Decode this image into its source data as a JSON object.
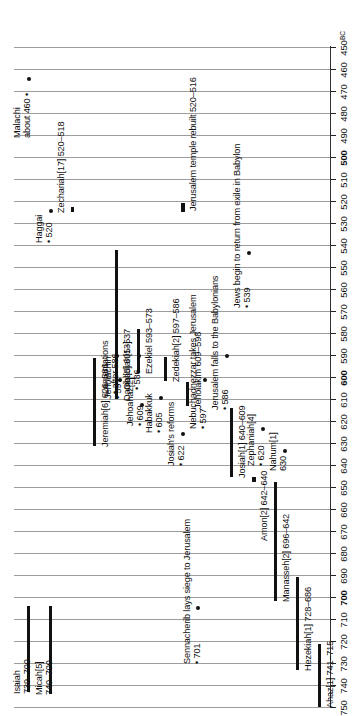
{
  "chart_data": {
    "type": "table",
    "orientation": "vertical-rotated",
    "xlabel": "",
    "ylabel": "BC",
    "axis_unit": "BC",
    "axis_range": [
      750,
      450
    ],
    "axis_direction": "750 at bottom to 450 at top",
    "tick_step": 10,
    "ticks": [
      750,
      740,
      730,
      720,
      710,
      700,
      690,
      680,
      670,
      660,
      650,
      640,
      630,
      620,
      610,
      600,
      590,
      580,
      570,
      560,
      550,
      540,
      530,
      520,
      510,
      500,
      490,
      480,
      470,
      460,
      450
    ],
    "bold_ticks": [
      700,
      600,
      500
    ],
    "grid": true,
    "legend": "none",
    "bars": [
      {
        "label": "Ahaz[1] 741–715",
        "name": "Ahaz",
        "bracket": "[1]",
        "start": 741,
        "end": 715
      },
      {
        "label": "Hezekiah[1] 728–686",
        "name": "Hezekiah",
        "bracket": "[1]",
        "start": 728,
        "end": 686
      },
      {
        "label": "Manasseh[2] 696–642",
        "name": "Manasseh",
        "bracket": "[2]",
        "start": 696,
        "end": 642
      },
      {
        "label": "Amon[2] 642–640",
        "name": "Amon",
        "bracket": "[2]",
        "start": 642,
        "end": 640
      },
      {
        "label": "Josiah[1] 640–609",
        "name": "Josiah",
        "bracket": "[1]",
        "start": 640,
        "end": 609
      },
      {
        "label": "Jehoiakim 609–598",
        "name": "Jehoiakim",
        "bracket": "",
        "start": 609,
        "end": 598
      },
      {
        "label": "Zedekiah[2] 597–586",
        "name": "Zedekiah",
        "bracket": "[2]",
        "start": 597,
        "end": 586
      },
      {
        "label": "Isaiah 739–700",
        "name": "Isaiah",
        "bracket": "",
        "start": 739,
        "end": 700
      },
      {
        "label": "Micah[5] 740–700",
        "name": "Micah",
        "bracket": "[5]",
        "start": 740,
        "end": 700
      },
      {
        "label": "Jeremiah[6] 626–586",
        "name": "Jeremiah",
        "bracket": "[6]",
        "start": 626,
        "end": 586
      },
      {
        "label": "Ezekiel 593–573",
        "name": "Ezekiel",
        "bracket": "",
        "start": 593,
        "end": 573
      },
      {
        "label": "Daniel[5] 605–537",
        "name": "Daniel",
        "bracket": "[5]",
        "start": 605,
        "end": 537
      },
      {
        "label": "Zechariah[17] 520–518",
        "name": "Zechariah",
        "bracket": "[17]",
        "start": 520,
        "end": 518
      },
      {
        "label": "Jerusalem temple rebuilt 520–516",
        "name": "Jerusalem temple rebuilt",
        "bracket": "",
        "start": 520,
        "end": 516
      }
    ],
    "points": [
      {
        "label": "Jehoahaz[2]",
        "sub": "• 609",
        "name": "Jehoahaz",
        "year": 609
      },
      {
        "label": "Jehoiachin",
        "sub": "• 597",
        "name": "Jehoiachin",
        "year": 597
      },
      {
        "label": "Nahum[1]",
        "sub": "630",
        "name": "Nahum",
        "year": 630
      },
      {
        "label": "Zephaniah[4]",
        "sub": "• 620",
        "name": "Zephaniah",
        "year": 620
      },
      {
        "label": "Habakkuk",
        "sub": "• 605",
        "name": "Habakkuk",
        "year": 605
      },
      {
        "label": "Obadiah[13]",
        "sub": "• 586",
        "name": "Obadiah",
        "year": 586
      },
      {
        "label": "Haggai",
        "sub": "• 520",
        "name": "Haggai",
        "year": 520
      },
      {
        "label": "Malachi",
        "sub": "about 460 •",
        "name": "Malachi",
        "year": 460
      },
      {
        "label": "Lamentations",
        "sub": "• after 586",
        "name": "Lamentations",
        "year": 586
      }
    ],
    "events": [
      {
        "label": "Sennacherib lays siege to Jerusalem",
        "sub": "• 701",
        "year": 701
      },
      {
        "label": "Josiah's reforms",
        "sub": "• 622",
        "year": 622
      },
      {
        "label": "Nebuchadnezzar takes Jerusalem",
        "sub": "• 597",
        "year": 597
      },
      {
        "label": "Jerusalem falls to the Babylonians",
        "sub": "• 586",
        "year": 586
      },
      {
        "label": "Jews begin to return from exile in Babylon",
        "sub": "• 539",
        "year": 539
      }
    ]
  },
  "axis": {
    "unit_label": "BC",
    "labels": [
      "750",
      "740",
      "730",
      "720",
      "710",
      "700",
      "690",
      "680",
      "670",
      "660",
      "650",
      "640",
      "630",
      "620",
      "610",
      "600",
      "590",
      "580",
      "570",
      "560",
      "550",
      "540",
      "530",
      "520",
      "510",
      "500",
      "490",
      "480",
      "470",
      "460",
      "450"
    ]
  },
  "items": {
    "ahaz": {
      "label": "Ahaz[1] 741–715"
    },
    "hezekiah": {
      "label": "Hezekiah[1] 728–686"
    },
    "manasseh": {
      "label": "Manasseh[2] 696–642"
    },
    "amon": {
      "label": "Amon[2] 642–640"
    },
    "josiah": {
      "label": "Josiah[1] 640–609"
    },
    "jehoahaz": {
      "label": "Jehoahaz[2]",
      "sub": "• 609"
    },
    "jehoiakim": {
      "label": "Jehoiakim 609–598"
    },
    "jehoiachin": {
      "label": "Jehoiachin",
      "sub": "• 597"
    },
    "zedekiah": {
      "label": "Zedekiah[2] 597–586"
    },
    "isaiah": {
      "label": "Isaiah",
      "sub": "739–700"
    },
    "micah": {
      "label": "Micah[5]",
      "sub": "740–700"
    },
    "nahum": {
      "label": "Nahum[1]",
      "sub": "630"
    },
    "zephaniah": {
      "label": "Zephaniah[4]",
      "sub": "• 620"
    },
    "jeremiah": {
      "label": "Jeremiah[6] 626–586"
    },
    "habakkuk": {
      "label": "Habakkuk",
      "sub": "• 605"
    },
    "daniel": {
      "label": "Daniel[5] 605–537"
    },
    "ezekiel": {
      "label": "Ezekiel 593–573"
    },
    "obadiah": {
      "label": "Obadiah[13]",
      "sub": "• 586"
    },
    "lamentations": {
      "label": "Lamentations",
      "sub": "• after 586"
    },
    "haggai": {
      "label": "Haggai",
      "sub": "• 520"
    },
    "zechariah": {
      "label": "Zechariah[17] 520–518"
    },
    "malachi": {
      "label": "Malachi",
      "sub": "about 460 •"
    },
    "temple": {
      "label": "Jerusalem temple rebuilt 520–516"
    },
    "sennacherib": {
      "label": "Sennacherib lays siege to Jerusalem",
      "sub": "• 701"
    },
    "reforms": {
      "label": "Josiah's reforms",
      "sub": "• 622"
    },
    "nebuchadnezzar": {
      "label": "Nebuchadnezzar takes Jerusalem",
      "sub": "• 597"
    },
    "fall": {
      "label": "Jerusalem falls to the Babylonians",
      "sub": "• 586"
    },
    "return": {
      "label": "Jews begin to return from exile in Babylon",
      "sub": "• 539"
    }
  }
}
